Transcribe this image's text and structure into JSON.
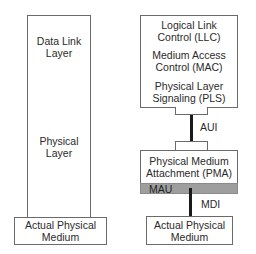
{
  "left_column": {
    "data_link_layer": "Data Link\nLayer",
    "physical_layer": "Physical\nLayer",
    "actual_physical_medium": "Actual Physical\nMedium"
  },
  "right_column": {
    "llc": "Logical Link\nControl (LLC)",
    "mac": "Medium Access\nControl (MAC)",
    "pls": "Physical Layer\nSignaling (PLS)",
    "aui_label": "AUI",
    "pma": "Physical Medium\nAttachment (PMA)",
    "mau_label": "MAU",
    "mdi_label": "MDI",
    "actual_physical_medium": "Actual Physical\nMedium"
  },
  "colors": {
    "border": "#6a6a6a",
    "mau_fill": "#9e9e9e",
    "connector_line": "#1a1a1a"
  }
}
